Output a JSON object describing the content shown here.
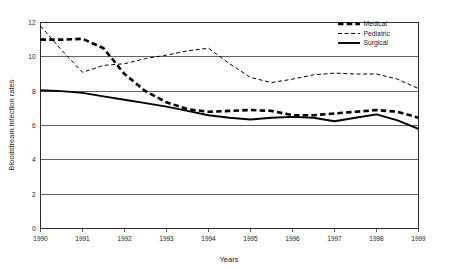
{
  "chart_data": {
    "type": "line",
    "title": "",
    "xlabel": "Years",
    "ylabel": "Bloodstream infection rates",
    "xlim": [
      1990,
      1999
    ],
    "ylim": [
      0,
      12
    ],
    "yticks": [
      0,
      2,
      4,
      6,
      8,
      10,
      12
    ],
    "xticks": [
      "1990",
      "1991",
      "1992",
      "1993",
      "1994",
      "1995",
      "1996",
      "1997",
      "1998",
      "1999"
    ],
    "grid": true,
    "legend_position": "top-right",
    "x": [
      1990,
      1990.5,
      1991,
      1991.5,
      1992,
      1992.5,
      1993,
      1993.5,
      1994,
      1994.5,
      1995,
      1995.5,
      1996,
      1996.5,
      1997,
      1997.5,
      1998,
      1998.5,
      1999
    ],
    "series": [
      {
        "name": "Medical",
        "style": "bold-dashed",
        "color": "#000000",
        "values": [
          11.0,
          11.0,
          11.05,
          10.5,
          9.0,
          8.0,
          7.35,
          6.95,
          6.8,
          6.85,
          6.9,
          6.85,
          6.6,
          6.6,
          6.7,
          6.8,
          6.9,
          6.8,
          6.45
        ]
      },
      {
        "name": "Pediatric",
        "style": "thin-dashed",
        "color": "#000000",
        "values": [
          11.8,
          10.4,
          9.1,
          9.5,
          9.6,
          9.9,
          10.1,
          10.35,
          10.5,
          9.6,
          8.8,
          8.5,
          8.7,
          8.95,
          9.05,
          9.0,
          9.0,
          8.7,
          8.15
        ]
      },
      {
        "name": "Surgical",
        "style": "solid",
        "color": "#000000",
        "values": [
          8.05,
          8.0,
          7.9,
          7.7,
          7.5,
          7.3,
          7.1,
          6.85,
          6.6,
          6.45,
          6.35,
          6.45,
          6.5,
          6.45,
          6.25,
          6.45,
          6.65,
          6.3,
          5.8
        ]
      }
    ]
  },
  "legend": {
    "items": [
      {
        "label": "Medical"
      },
      {
        "label": "Pediatric"
      },
      {
        "label": "Surgical"
      }
    ]
  }
}
